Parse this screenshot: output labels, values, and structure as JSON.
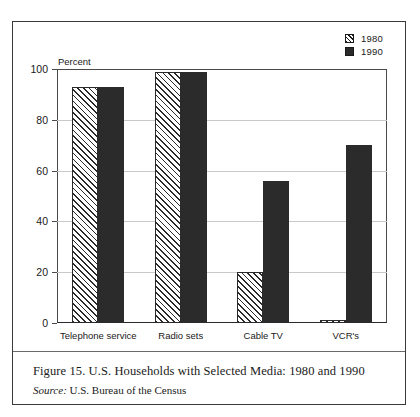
{
  "chart_data": {
    "type": "bar",
    "title": "Figure 15. U.S. Households with Selected Media: 1980 and 1990",
    "xlabel": "",
    "ylabel": "Percent",
    "ylim": [
      0,
      100
    ],
    "yticks": [
      0,
      20,
      40,
      60,
      80,
      100
    ],
    "grid": true,
    "legend_position": "top-right",
    "categories": [
      "Telephone service",
      "Radio sets",
      "Cable TV",
      "VCR's"
    ],
    "series": [
      {
        "name": "1980",
        "values": [
          93,
          99,
          20,
          1
        ]
      },
      {
        "name": "1990",
        "values": [
          93,
          99,
          56,
          70
        ]
      }
    ]
  },
  "legend": {
    "items": [
      {
        "label": "1980",
        "swatch": "hatched-square"
      },
      {
        "label": "1990",
        "swatch": "solid-square"
      }
    ]
  },
  "caption": {
    "figure_text": "Figure 15. U.S. Households with Selected Media: 1980 and 1990",
    "source_word": "Source:",
    "source_text": "U.S. Bureau of the Census"
  },
  "colors": {
    "bar_1990": "#2b2b2b",
    "bar_1980_outline": "#2a2a2a",
    "gridline": "#c9c9c9",
    "frame": "#3a3a3a"
  }
}
